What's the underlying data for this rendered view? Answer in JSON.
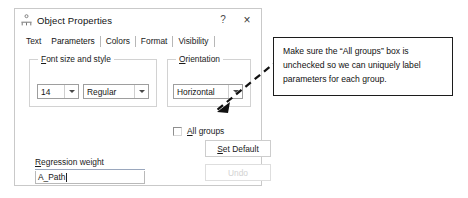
{
  "dialog": {
    "title": "Object Properties",
    "icon": "path-diagram-icon",
    "help_label": "?",
    "close_label": "×",
    "tabs": [
      {
        "label": "Text",
        "active": false
      },
      {
        "label": "Parameters",
        "active": true
      },
      {
        "label": "Colors",
        "active": false
      },
      {
        "label": "Format",
        "active": false
      },
      {
        "label": "Visibility",
        "active": false
      }
    ],
    "groups": {
      "font": {
        "legend_prefix": "F",
        "legend_rest": "ont size and style",
        "size_value": "14",
        "style_value": "Regular"
      },
      "orientation": {
        "legend_prefix": "O",
        "legend_rest": "rientation",
        "value": "Horizontal"
      }
    },
    "all_groups": {
      "label_prefix": "A",
      "label_rest": "ll groups",
      "checked": false
    },
    "buttons": {
      "set_default_prefix": "S",
      "set_default_rest": "et Default",
      "undo_label": "Undo",
      "undo_enabled": false
    },
    "regression_weight": {
      "label_prefix": "R",
      "label_rest": "egression weight",
      "value": "A_Path"
    }
  },
  "annotation": {
    "text": "Make sure the “All groups” box is unchecked so we can uniquely label parameters for each group.",
    "arrow": "dashed-arrow-pointing-to-all-groups-checkbox"
  },
  "colors": {
    "dialog_border": "#c9c9c9",
    "callout_border": "#1c1c1c",
    "field_underline": "#9aa7bd",
    "disabled_text": "#d2d2d2"
  }
}
